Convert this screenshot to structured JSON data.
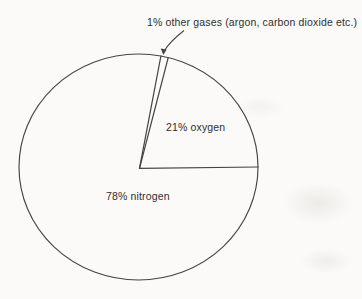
{
  "figure": {
    "background_color": "#fbfaf8",
    "line_color": "#454545",
    "text_color": "#2e2e2e"
  },
  "chart_data": {
    "type": "pie",
    "title": "",
    "slices": [
      {
        "name": "nitrogen",
        "value": 78,
        "label": "78% nitrogen"
      },
      {
        "name": "oxygen",
        "value": 21,
        "label": "21% oxygen"
      },
      {
        "name": "other gases",
        "value": 1,
        "label": "1% other gases (argon, carbon dioxide etc.)"
      }
    ],
    "annotation": {
      "text": "1% other gases (argon, carbon dioxide etc.)",
      "target_slice": "other gases",
      "style": "curved arrow pointing to thin sliver at top of pie"
    },
    "start_angle_deg": 0,
    "direction": "counterclockwise",
    "draw_order_indices": [
      1,
      2
    ],
    "legend": "none",
    "fill": "none (outline-only pie, scanned line drawing)"
  }
}
